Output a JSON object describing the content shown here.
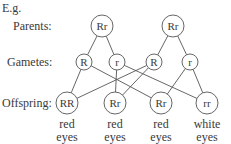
{
  "intro": "E.g.",
  "row_labels": {
    "parents": "Parents:",
    "gametes": "Gametes:",
    "offspring": "Offspring:"
  },
  "parents": [
    {
      "genotype": "Rr",
      "cx": 102,
      "cy": 26
    },
    {
      "genotype": "Rr",
      "cx": 173,
      "cy": 26
    }
  ],
  "gametes": [
    {
      "allele": "R",
      "cx": 84,
      "cy": 62
    },
    {
      "allele": "r",
      "cx": 117,
      "cy": 62
    },
    {
      "allele": "R",
      "cx": 154,
      "cy": 62
    },
    {
      "allele": "r",
      "cx": 190,
      "cy": 62
    }
  ],
  "offspring": [
    {
      "genotype": "RR",
      "cx": 67,
      "cy": 103,
      "phenotype_line1": "red",
      "phenotype_line2": "eyes"
    },
    {
      "genotype": "Rr",
      "cx": 115,
      "cy": 103,
      "phenotype_line1": "red",
      "phenotype_line2": "eyes"
    },
    {
      "genotype": "Rr",
      "cx": 161,
      "cy": 103,
      "phenotype_line1": "red",
      "phenotype_line2": "eyes"
    },
    {
      "genotype": "rr",
      "cx": 207,
      "cy": 103,
      "phenotype_line1": "white",
      "phenotype_line2": "eyes"
    }
  ],
  "edges": {
    "parent_to_gamete": [
      [
        0,
        0
      ],
      [
        0,
        1
      ],
      [
        1,
        2
      ],
      [
        1,
        3
      ]
    ],
    "gamete_to_offspring": [
      [
        0,
        0
      ],
      [
        0,
        2
      ],
      [
        1,
        1
      ],
      [
        1,
        3
      ],
      [
        2,
        0
      ],
      [
        2,
        1
      ],
      [
        3,
        2
      ],
      [
        3,
        3
      ]
    ]
  }
}
